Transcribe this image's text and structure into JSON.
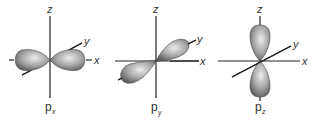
{
  "diagram": {
    "colors": {
      "lobe_dark": "#6e6e6e",
      "lobe_light": "#e8e8e8",
      "axis": "#222222",
      "text": "#333333"
    },
    "panels": [
      {
        "id": "px",
        "orbital_label": "p",
        "orbital_subscript": "x",
        "axis_labels": {
          "z": "z",
          "y": "y",
          "x": "x"
        },
        "lobe_axis": "x"
      },
      {
        "id": "py",
        "orbital_label": "p",
        "orbital_subscript": "y",
        "axis_labels": {
          "z": "z",
          "y": "y",
          "x": "x"
        },
        "lobe_axis": "y"
      },
      {
        "id": "pz",
        "orbital_label": "p",
        "orbital_subscript": "z",
        "axis_labels": {
          "z": "z",
          "y": "y",
          "x": "x"
        },
        "lobe_axis": "z"
      }
    ]
  }
}
